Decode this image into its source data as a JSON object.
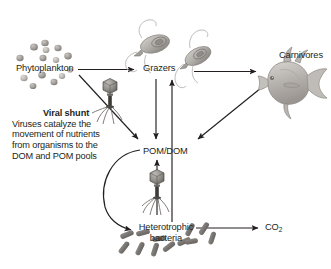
{
  "figure": {
    "background_color": "#ffffff",
    "text_color": "#231f20",
    "arrow_color": "#231f20",
    "width": 331,
    "height": 269
  },
  "nodes": {
    "phytoplankton": {
      "label": "Phytoplankton",
      "icon": "phytoplankton-cells-icon",
      "x": 16,
      "y": 63
    },
    "grazers": {
      "label": "Grazers",
      "icon": "flagellate-grazer-icon",
      "x": 143,
      "y": 63
    },
    "carnivores": {
      "label": "Carnivores",
      "icon": "fish-icon",
      "x": 279,
      "y": 50
    },
    "pom_dom": {
      "label": "POM/DOM",
      "x": 143,
      "y": 146
    },
    "heterotrophic_bacteria": {
      "label": "Heterotrophic bacteria",
      "line1": "Heterotrophic",
      "line2": "bacteria",
      "icon": "rod-bacteria-icon",
      "x": 138,
      "y": 222
    },
    "co2": {
      "label_main": "CO",
      "label_sub": "2",
      "label": "CO2",
      "x": 265,
      "y": 222
    }
  },
  "annotation": {
    "viral_shunt": {
      "title": "Viral shunt",
      "lines": [
        "Viruses catalyze the",
        "movement of nutrients",
        "from organisms to the",
        "DOM and POM pools"
      ],
      "line1": "Viruses catalyze the",
      "line2": "movement of nutrients",
      "line3": "from organisms to the",
      "line4": "DOM and POM pools"
    }
  },
  "icons": {
    "virus_upper": "bacteriophage-icon",
    "virus_lower": "bacteriophage-icon",
    "grazer_left": "flagellate-icon",
    "grazer_right": "flagellate-icon",
    "fish": "fish-icon"
  },
  "flows": [
    {
      "name": "phytoplankton-to-grazers",
      "from": "Phytoplankton",
      "to": "Grazers",
      "style": "straight"
    },
    {
      "name": "grazers-to-carnivores",
      "from": "Grazers",
      "to": "Carnivores",
      "style": "straight"
    },
    {
      "name": "phytoplankton-to-pomdom",
      "from": "Phytoplankton",
      "to": "POM/DOM",
      "style": "diagonal-through-virus"
    },
    {
      "name": "grazers-to-pomdom",
      "from": "Grazers",
      "to": "POM/DOM",
      "style": "vertical-down"
    },
    {
      "name": "carnivores-to-pomdom",
      "from": "Carnivores",
      "to": "POM/DOM",
      "style": "diagonal"
    },
    {
      "name": "pomdom-to-heterotrophic-bacteria",
      "from": "POM/DOM",
      "to": "Heterotrophic bacteria",
      "style": "curved"
    },
    {
      "name": "heterotrophic-bacteria-to-pomdom",
      "from": "Heterotrophic bacteria",
      "to": "POM/DOM",
      "style": "vertical-up-through-virus"
    },
    {
      "name": "heterotrophic-bacteria-to-grazers",
      "from": "Heterotrophic bacteria",
      "to": "Grazers",
      "style": "vertical-up-long"
    },
    {
      "name": "heterotrophic-bacteria-to-co2",
      "from": "Heterotrophic bacteria",
      "to": "CO2",
      "style": "straight"
    }
  ]
}
